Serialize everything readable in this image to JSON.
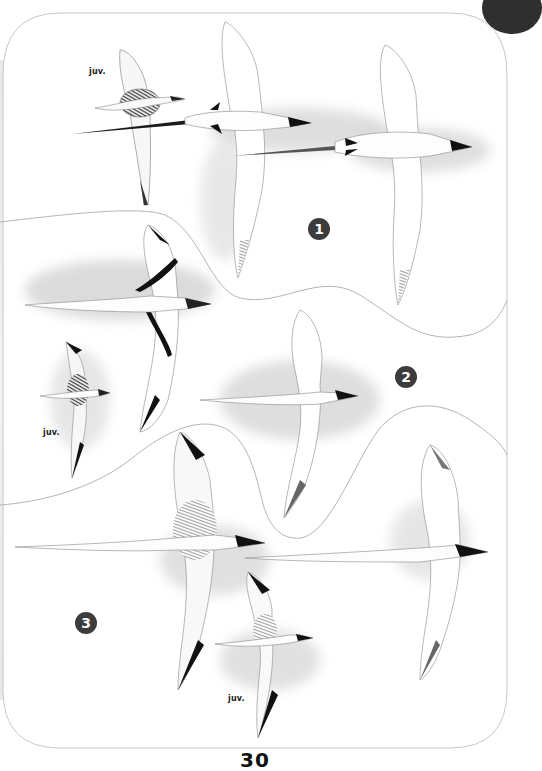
{
  "plate": {
    "page_number": "30",
    "sections": [
      {
        "number": "1",
        "badge_label": "1",
        "juvenile_label": "juv."
      },
      {
        "number": "2",
        "badge_label": "2",
        "juvenile_label": "juv."
      },
      {
        "number": "3",
        "badge_label": "3",
        "juvenile_label": "juv."
      }
    ],
    "colors": {
      "badge": "#3c3c3c",
      "frame_line": "#c8c8c8",
      "corner_tab": "#2f2f2f",
      "wing_black": "#151515",
      "shadow_grey": "#bdbdbd"
    }
  }
}
